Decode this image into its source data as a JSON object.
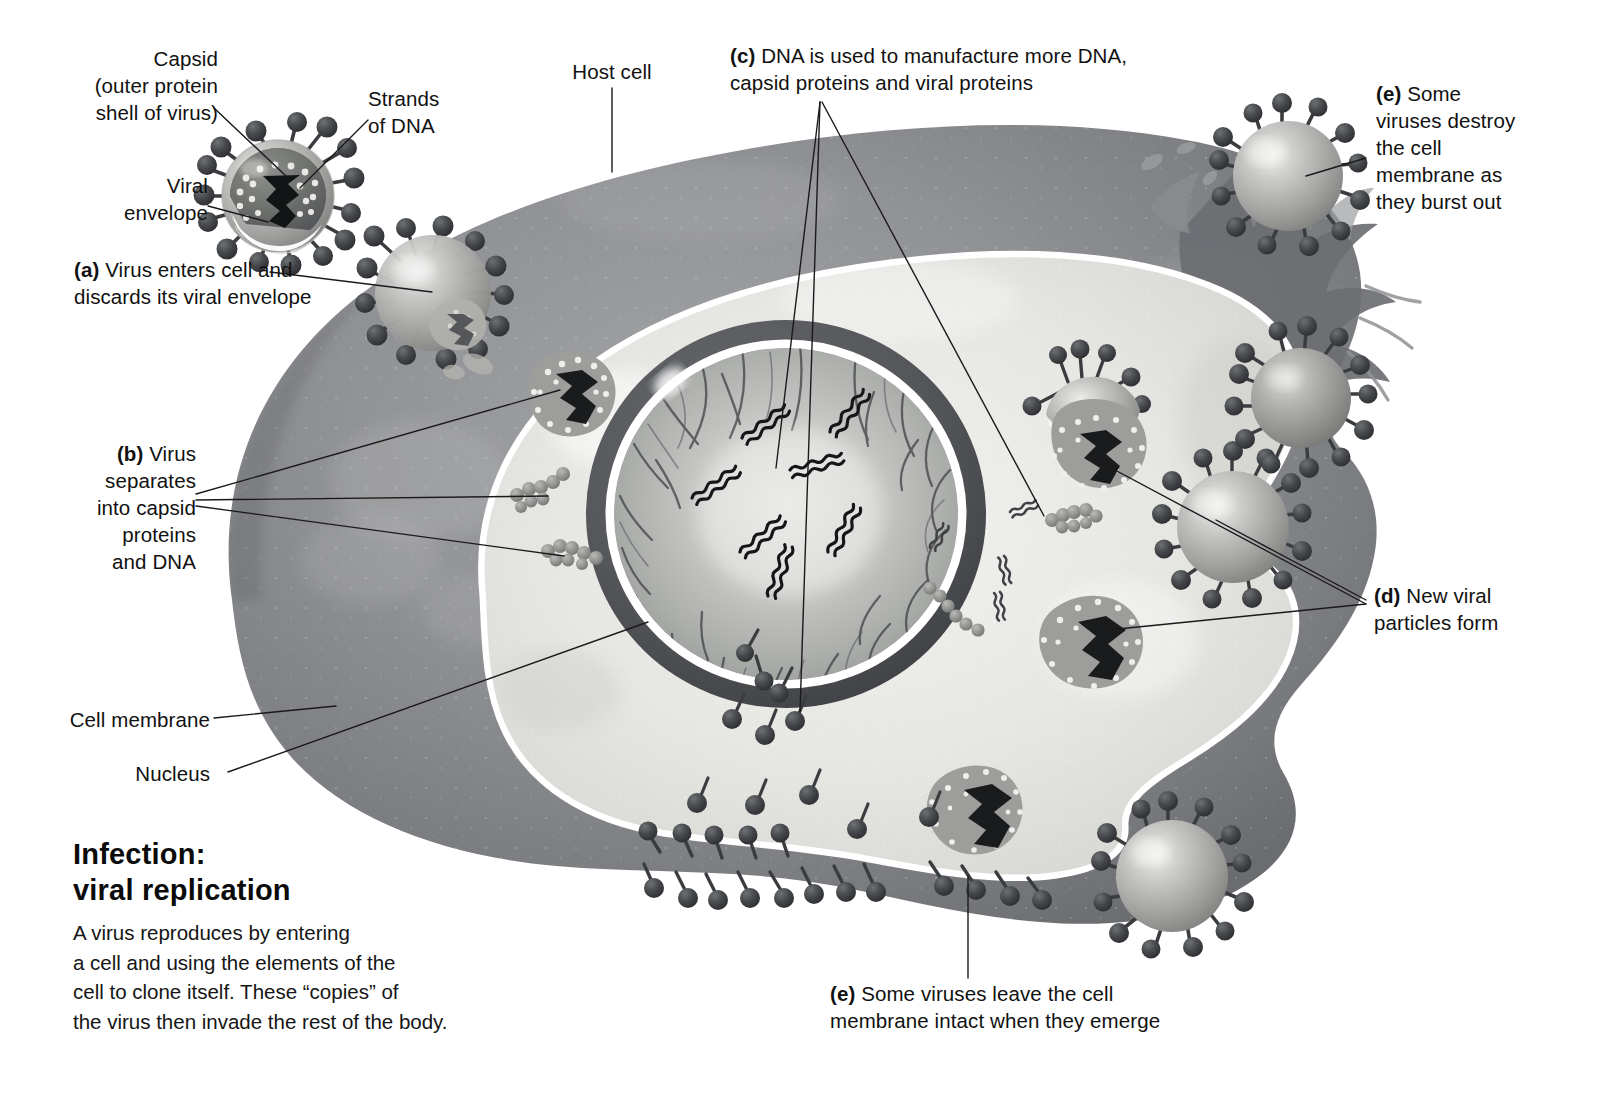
{
  "figure": {
    "title_line1": "Infection:",
    "title_line2": "viral replication",
    "description": "A virus reproduces by entering\na cell and using the elements of the\ncell to clone itself. These “copies” of\nthe virus then invade the rest of the body."
  },
  "labels": {
    "capsid": "Capsid\n(outer protein\nshell of virus)",
    "strands_of_dna": "Strands\nof DNA",
    "viral_envelope": "Viral\nenvelope",
    "step_a": "(a) Virus enters cell and\ndiscards its viral envelope",
    "host_cell": "Host cell",
    "step_c": "(c) DNA is used to manufacture more DNA,\ncapsid proteins and viral proteins",
    "step_e_burst": "(e) Some\nviruses destroy\nthe cell\nmembrane as\nthey burst out",
    "step_b": "(b) Virus\nseparates\ninto capsid\nproteins\nand DNA",
    "step_d": "(d) New viral\nparticles form",
    "cell_membrane": "Cell membrane",
    "nucleus": "Nucleus",
    "step_e_intact": "(e) Some viruses leave the cell\nmembrane intact when they emerge"
  },
  "label_prefixes": {
    "a": "(a)",
    "b": "(b)",
    "c": "(c)",
    "d": "(d)",
    "e": "(e)"
  },
  "colors": {
    "background": "#ffffff",
    "cytoplasm_outer": "#8f9093",
    "cytoplasm_outer_dark": "#6e7073",
    "cytoplasm_inner": "#e8e8e6",
    "membrane_white": "#ffffff",
    "nucleus_ring": "#56585c",
    "nucleus_inner": "#b9bab7",
    "virus_body": "#a9aaa7",
    "spike": "#3b3d40",
    "capsid_dark": "#4a4c50",
    "dna_dark": "#17181a",
    "leader_line": "#1a1a1a",
    "text": "#111111"
  },
  "structures": {
    "host_cell": "large irregular rounded cell",
    "nucleus": "central dark-ringed nucleus with chromatin threads and DNA helices",
    "free_virus": "enveloped virus with spike proteins, cut-away showing capsid and DNA"
  }
}
